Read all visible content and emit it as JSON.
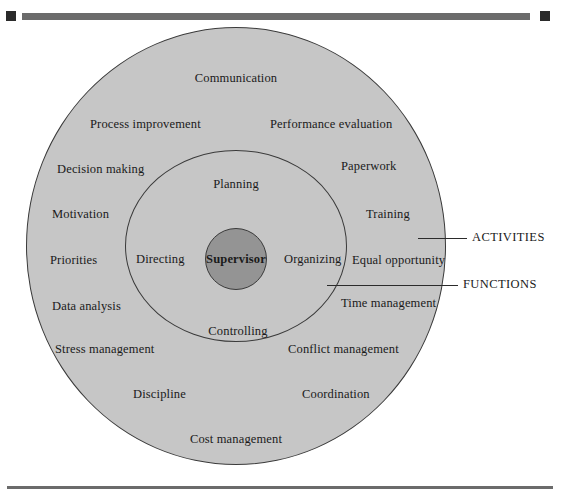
{
  "figure": {
    "colors": {
      "outer_ring_fill": "#c6c6c6",
      "middle_ring_fill": "#c6c6c6",
      "inner_circle_fill": "#949494",
      "stroke": "#3a3a3a",
      "rule": "#6b6b6b",
      "rule_cap": "#2b2b2b",
      "text": "#1a1a1a",
      "page_background": "#ffffff"
    }
  },
  "core": {
    "label": "Supervisor"
  },
  "functions": {
    "callout_label": "FUNCTIONS",
    "items": [
      {
        "label": "Planning"
      },
      {
        "label": "Organizing"
      },
      {
        "label": "Controlling"
      },
      {
        "label": "Directing"
      }
    ]
  },
  "activities": {
    "callout_label": "ACTIVITIES",
    "items": [
      {
        "label": "Communication"
      },
      {
        "label": "Process improvement"
      },
      {
        "label": "Performance evaluation"
      },
      {
        "label": "Decision making"
      },
      {
        "label": "Paperwork"
      },
      {
        "label": "Motivation"
      },
      {
        "label": "Training"
      },
      {
        "label": "Priorities"
      },
      {
        "label": "Equal opportunity"
      },
      {
        "label": "Data analysis"
      },
      {
        "label": "Time management"
      },
      {
        "label": "Stress management"
      },
      {
        "label": "Conflict management"
      },
      {
        "label": "Discipline"
      },
      {
        "label": "Coordination"
      },
      {
        "label": "Cost management"
      }
    ]
  }
}
